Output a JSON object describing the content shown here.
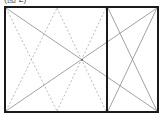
{
  "caption": "(图 2)",
  "diagram": {
    "type": "window-opening-elevation",
    "outer_frame": {
      "x1": 5,
      "y1": 7,
      "x2": 158,
      "y2": 112
    },
    "mullion_x": 107,
    "colors": {
      "frame": "#1a1a1a",
      "solid_line": "#8a8a8a",
      "dashed_line": "#a0a0a0"
    },
    "panels": [
      {
        "name": "left-panel",
        "opening": "tilt-and-turn (dashed)"
      },
      {
        "name": "right-panel",
        "opening": "casement"
      }
    ]
  }
}
